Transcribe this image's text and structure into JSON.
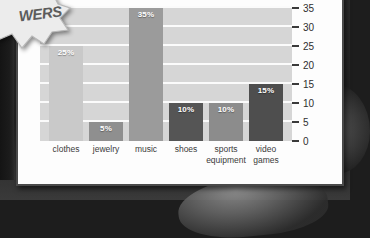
{
  "overlay": {
    "burst_text": "WERS",
    "burst_icon": "starburst-callout"
  },
  "chart_data": {
    "type": "bar",
    "title": "",
    "xlabel": "",
    "ylabel": "",
    "categories": [
      "clothes",
      "jewelry",
      "music",
      "shoes",
      "sports equipment",
      "video games"
    ],
    "values": [
      25,
      5,
      35,
      10,
      10,
      15
    ],
    "data_labels": [
      "25%",
      "5%",
      "35%",
      "10%",
      "10%",
      "15%"
    ],
    "bar_colors": [
      "#c9c9c9",
      "#8f8f8f",
      "#9b9b9b",
      "#555555",
      "#8c8c8c",
      "#4e4e4e"
    ],
    "ylim": [
      0,
      35
    ],
    "yticks": [
      0,
      5,
      10,
      15,
      20,
      25,
      30,
      35
    ],
    "ytick_labels": [
      "0",
      "5",
      "10",
      "15",
      "20",
      "25",
      "30",
      "35"
    ],
    "y_axis_position": "right",
    "grid": true,
    "gridline_color": "#fbfbfb",
    "plot_background": "#d6d6d6",
    "legend": null,
    "legend_position": "none"
  }
}
